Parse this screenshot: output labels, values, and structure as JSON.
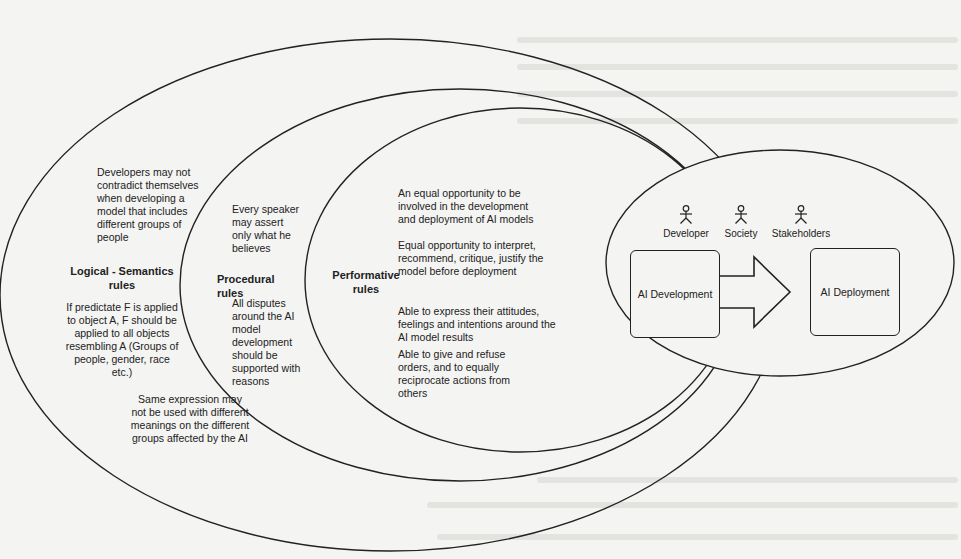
{
  "diagram": {
    "type": "nested-ellipses",
    "rings": [
      {
        "id": "logical-semantics",
        "title": "Logical - Semantics\nrules",
        "notes": [
          "Developers may not\ncontradict themselves\nwhen developing a\nmodel that includes\ndifferent groups of\npeople",
          "If predictate F is applied\nto object A, F should be\napplied to all objects\nresembling A (Groups of\npeople, gender, race\netc.)",
          "Same expression may\nnot be used with different\nmeanings on the different\ngroups affected by the AI"
        ]
      },
      {
        "id": "procedural",
        "title": "Procedural\nrules",
        "notes": [
          "Every speaker\nmay assert\nonly what he\nbelieves",
          "All disputes\naround the AI\nmodel\ndevelopment\nshould be\nsupported with\nreasons"
        ]
      },
      {
        "id": "performative",
        "title": "Performative\nrules",
        "notes": [
          "An equal opportunity to be\ninvolved in the development\nand deployment of AI models",
          "Equal opportunity to interpret,\nrecommend, critique, justify the\nmodel before deployment",
          "Able to express their attitudes,\nfeelings and intentions around the\nAI model results",
          "Able to give and refuse\norders, and to equally\nreciprocate actions from\nothers"
        ]
      }
    ],
    "core": {
      "actors": [
        {
          "label": "Developer",
          "icon": "stick-figure-icon"
        },
        {
          "label": "Society",
          "icon": "stick-figure-icon"
        },
        {
          "label": "Stakeholders",
          "icon": "stick-figure-icon"
        }
      ],
      "source_box": "AI Development",
      "target_box": "AI Deployment",
      "connector": "block-arrow-right"
    },
    "colors": {
      "background": "#f4f4f2",
      "stroke": "#222222",
      "text": "#222222"
    }
  }
}
